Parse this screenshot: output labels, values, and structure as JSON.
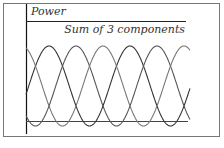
{
  "chart_data": {
    "type": "line",
    "title": "",
    "ylabel": "Power",
    "xlabel": "",
    "annotations": [
      "Sum of 3 components"
    ],
    "legend": "none",
    "grid": false,
    "series": [
      {
        "name": "component 1",
        "function": "sin^2",
        "phase_deg": 0,
        "amplitude": 1
      },
      {
        "name": "component 2",
        "function": "sin^2",
        "phase_deg": 120,
        "amplitude": 1
      },
      {
        "name": "component 3",
        "function": "sin^2",
        "phase_deg": 240,
        "amplitude": 1
      },
      {
        "name": "Sum of 3 components",
        "function": "constant",
        "value": 1.5
      }
    ],
    "x_range_cycles": [
      0,
      2.05
    ],
    "ylim": [
      0,
      1.7
    ],
    "colors": {
      "frame": "#666666",
      "axis": "#111111",
      "waves": [
        "#333333",
        "#555555",
        "#777777"
      ],
      "sum": "#222222"
    }
  },
  "caption": ""
}
